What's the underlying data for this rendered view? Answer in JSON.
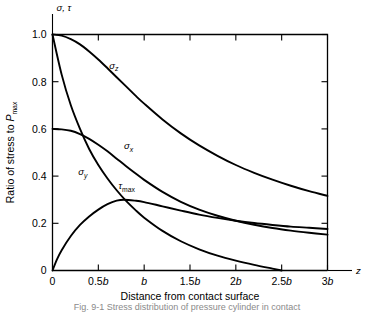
{
  "figure": {
    "caption": "Fig. 9-1 Stress distribution of pressure cylinder in contact"
  },
  "chart_data": {
    "type": "line",
    "title": "",
    "xlabel": "Distance from contact surface",
    "ylabel": "Ratio of stress to P",
    "ylabel_sub": "max",
    "x_axis_symbol": "z",
    "y_axis_symbol": "σ, τ",
    "xlim": [
      0,
      3
    ],
    "ylim": [
      0,
      1.0
    ],
    "grid": false,
    "legend": "inline-curve-labels",
    "x_ticks": [
      0,
      0.5,
      1,
      1.5,
      2,
      2.5,
      3
    ],
    "x_tick_labels": [
      "0",
      "0.5b",
      "b",
      "1.5b",
      "2b",
      "2.5b",
      "3b"
    ],
    "y_ticks": [
      0,
      0.2,
      0.4,
      0.6,
      0.8,
      1.0
    ],
    "y_tick_labels": [
      "0",
      "0.2",
      "0.4",
      "0.6",
      "0.8",
      "1.0"
    ],
    "series": [
      {
        "name": "σz",
        "label_base": "σ",
        "label_sub": "z",
        "label_x": 0.62,
        "label_y": 0.855,
        "x": [
          0,
          0.1,
          0.2,
          0.3,
          0.4,
          0.5,
          0.6,
          0.7,
          0.8,
          0.9,
          1.0,
          1.2,
          1.4,
          1.6,
          1.8,
          2.0,
          2.2,
          2.4,
          2.6,
          2.8,
          3.0
        ],
        "values": [
          1.0,
          0.995,
          0.98,
          0.958,
          0.928,
          0.894,
          0.857,
          0.819,
          0.781,
          0.743,
          0.707,
          0.64,
          0.581,
          0.53,
          0.486,
          0.447,
          0.414,
          0.385,
          0.359,
          0.336,
          0.316
        ]
      },
      {
        "name": "σx",
        "label_base": "σ",
        "label_sub": "x",
        "label_x": 0.78,
        "label_y": 0.515,
        "x": [
          0,
          0.1,
          0.2,
          0.3,
          0.4,
          0.5,
          0.6,
          0.7,
          0.8,
          0.9,
          1.0,
          1.2,
          1.4,
          1.6,
          1.8,
          2.0,
          2.2,
          2.4,
          2.6,
          2.8,
          3.0
        ],
        "values": [
          0.6,
          0.598,
          0.592,
          0.578,
          0.558,
          0.533,
          0.505,
          0.474,
          0.443,
          0.413,
          0.384,
          0.333,
          0.291,
          0.258,
          0.232,
          0.211,
          0.194,
          0.18,
          0.169,
          0.16,
          0.152
        ]
      },
      {
        "name": "σy",
        "label_base": "σ",
        "label_sub": "y",
        "label_x": 0.28,
        "label_y": 0.405,
        "x": [
          0,
          0.1,
          0.2,
          0.3,
          0.4,
          0.5,
          0.6,
          0.7,
          0.8,
          0.9,
          1.0,
          1.2,
          1.4,
          1.6,
          1.8,
          2.0,
          2.2,
          2.4,
          2.5
        ],
        "values": [
          1.0,
          0.83,
          0.7,
          0.6,
          0.515,
          0.447,
          0.39,
          0.34,
          0.296,
          0.258,
          0.224,
          0.168,
          0.124,
          0.09,
          0.063,
          0.042,
          0.024,
          0.008,
          0.0
        ]
      },
      {
        "name": "τmax",
        "label_base": "τ",
        "label_sub": "max",
        "label_x": 0.72,
        "label_y": 0.345,
        "x": [
          0,
          0.05,
          0.1,
          0.2,
          0.3,
          0.4,
          0.5,
          0.6,
          0.7,
          0.78,
          0.9,
          1.0,
          1.2,
          1.4,
          1.6,
          1.8,
          2.0,
          2.2,
          2.4,
          2.6,
          2.8,
          3.0
        ],
        "values": [
          0.0,
          0.048,
          0.086,
          0.146,
          0.193,
          0.229,
          0.258,
          0.281,
          0.296,
          0.3,
          0.296,
          0.29,
          0.272,
          0.254,
          0.237,
          0.223,
          0.211,
          0.201,
          0.193,
          0.186,
          0.181,
          0.176
        ]
      }
    ]
  }
}
